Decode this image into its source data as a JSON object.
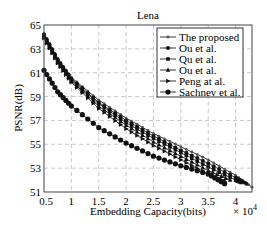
{
  "chart_data": {
    "type": "line",
    "title": "Lena",
    "xlabel": "Embedding Capacity(bits)",
    "ylabel": "PSNR(dB)",
    "x_multiplier_label": "× 10^4",
    "xlim": [
      0.5,
      4.3
    ],
    "ylim": [
      51,
      65
    ],
    "xticks": [
      "0.5",
      "1",
      "1.5",
      "2",
      "2.5",
      "3",
      "3.5",
      "4"
    ],
    "xtick_values": [
      0.5,
      1,
      1.5,
      2,
      2.5,
      3,
      3.5,
      4
    ],
    "yticks": [
      "51",
      "53",
      "55",
      "57",
      "59",
      "61",
      "63",
      "65"
    ],
    "ytick_values": [
      51,
      53,
      55,
      57,
      59,
      61,
      63,
      65
    ],
    "grid": true,
    "legend_position": "upper right",
    "series": [
      {
        "name": "The proposed",
        "marker": "dot-small",
        "x": [
          0.5,
          0.75,
          1.0,
          1.5,
          2.0,
          2.5,
          3.0,
          3.5,
          4.0,
          4.3
        ],
        "values": [
          64.3,
          62.2,
          60.6,
          58.7,
          57.2,
          55.9,
          54.8,
          53.7,
          52.4,
          51.4
        ]
      },
      {
        "name": "Ou et al.",
        "marker": "dot",
        "x": [
          0.5,
          0.75,
          1.0,
          1.5,
          2.0,
          2.5,
          3.0,
          3.5,
          4.0,
          4.2
        ],
        "values": [
          64.2,
          62.1,
          60.5,
          58.5,
          57.0,
          55.7,
          54.5,
          53.4,
          52.2,
          51.7
        ]
      },
      {
        "name": "Qu et al.",
        "marker": "square",
        "x": [
          0.5,
          0.75,
          1.0,
          1.5,
          2.0,
          2.5,
          3.0,
          3.5,
          4.0,
          4.1
        ],
        "values": [
          64.1,
          62.0,
          60.4,
          58.4,
          56.8,
          55.5,
          54.3,
          53.1,
          52.0,
          51.8
        ]
      },
      {
        "name": "Ou et al.",
        "marker": "triangle-up",
        "x": [
          0.5,
          0.75,
          1.0,
          1.5,
          2.0,
          2.5,
          3.0,
          3.5,
          3.9
        ],
        "values": [
          64.0,
          61.9,
          60.3,
          58.2,
          56.6,
          55.2,
          54.0,
          52.8,
          52.0
        ]
      },
      {
        "name": "Peng at al.",
        "marker": "triangle-right",
        "x": [
          0.5,
          0.75,
          1.0,
          1.5,
          2.0,
          2.5,
          3.0,
          3.5,
          3.8
        ],
        "values": [
          63.9,
          61.8,
          60.2,
          58.0,
          56.3,
          54.9,
          53.7,
          52.5,
          51.9
        ]
      },
      {
        "name": "Sachnev et al.",
        "marker": "star",
        "x": [
          0.5,
          0.75,
          1.0,
          1.5,
          2.0,
          2.5,
          3.0,
          3.5,
          3.8
        ],
        "values": [
          61.2,
          59.4,
          58.2,
          56.4,
          55.1,
          54.0,
          53.2,
          52.5,
          51.7
        ]
      }
    ]
  }
}
